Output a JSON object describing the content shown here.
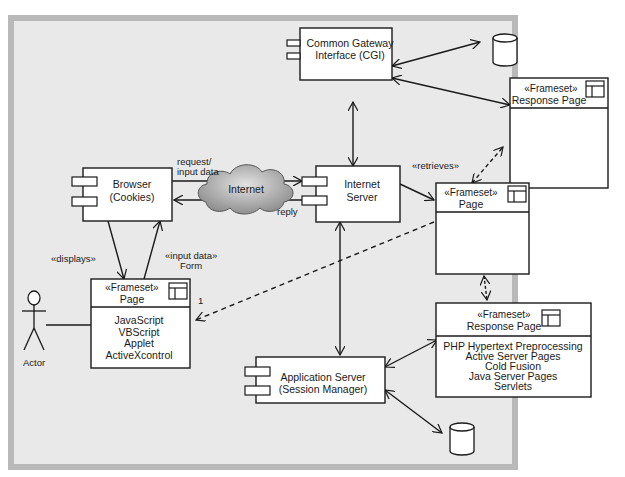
{
  "caption": "yy…",
  "colors": {
    "outer_border": "#b9b9b9",
    "canvas_bg": "#e9e9e9",
    "box_fill": "#ffffff",
    "stroke": "#1a1a1a",
    "cloud_fill": "#a8a8a8"
  },
  "nodes": {
    "cgi": {
      "line1": "Common Gateway",
      "line2": "Interface (CGI)"
    },
    "browser": {
      "line1": "Browser",
      "line2": "(Cookies)"
    },
    "internet": {
      "label": "Internet"
    },
    "internet_server": {
      "line1": "Internet",
      "line2": "Server"
    },
    "app_server": {
      "line1": "Application Server",
      "line2": "(Session Manager)"
    },
    "response_page_top": {
      "stereotype": "«Frameset»",
      "name": "Response Page"
    },
    "page_mid": {
      "stereotype": "«Frameset»",
      "name": "Page"
    },
    "page_client": {
      "stereotype": "«Frameset»",
      "name": "Page",
      "items": [
        "JavaScript",
        "VBScript",
        "Applet",
        "ActiveXcontrol"
      ]
    },
    "response_page_bottom": {
      "stereotype": "«Frameset»",
      "name": "Response Page",
      "items": [
        "PHP Hypertext Preprocessing",
        "Active Server Pages",
        "Cold Fusion",
        "Java Server Pages",
        "Servlets"
      ]
    },
    "actor": {
      "label": "Actor"
    }
  },
  "edges": {
    "request": {
      "line1": "request/",
      "line2": "input data"
    },
    "reply": "reply",
    "retrieves": "«retrieves»",
    "displays": "«displays»",
    "input_form": {
      "line1": "«input data»",
      "line2": "Form"
    },
    "multiplicity": "1"
  }
}
